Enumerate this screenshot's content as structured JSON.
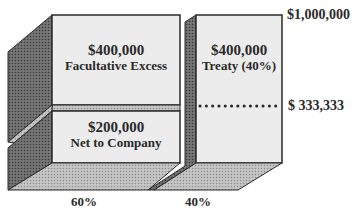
{
  "diagram": {
    "type": "layered reinsurance block diagram",
    "blocks": [
      {
        "id": "facultative",
        "amount": "$400,000",
        "label": "Facultative Excess"
      },
      {
        "id": "treaty",
        "amount": "$400,000",
        "label": "Treaty (40%)"
      },
      {
        "id": "net",
        "amount": "$200,000",
        "label": "Net to Company"
      }
    ],
    "limits": {
      "top": "$1,000,000",
      "retention": "$ 333,333"
    },
    "shares": {
      "left": "60%",
      "right": "40%"
    },
    "colors": {
      "front_face": "#ececec",
      "side_face": "#5a5a5a",
      "bottom_face": "#b4b4b4",
      "outline": "#2a2a2a",
      "text": "#2a2a2a"
    }
  }
}
